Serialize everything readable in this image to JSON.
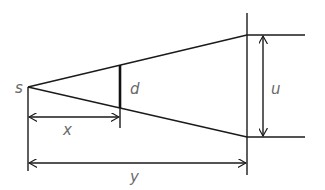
{
  "diagram": {
    "type": "geometry-similar-triangles",
    "labels": {
      "source": "s",
      "object_size": "d",
      "image_size": "u",
      "object_distance": "x",
      "image_distance": "y"
    },
    "colors": {
      "line": "#1a1a1a",
      "label": "#6a6a6a",
      "background": "#ffffff"
    }
  }
}
